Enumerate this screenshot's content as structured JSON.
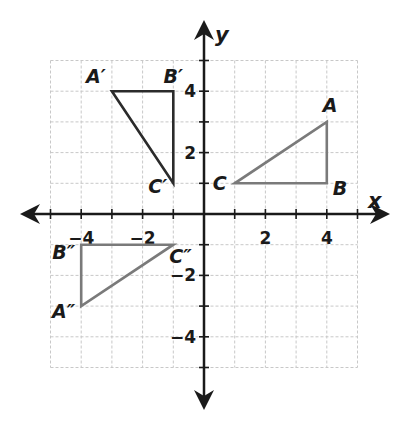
{
  "diagram": {
    "type": "coordinate-plane",
    "grid": {
      "xmin": -5,
      "xmax": 5,
      "ymin": -5,
      "ymax": 5,
      "step": 1,
      "color": "#c8c8c8"
    },
    "axes": {
      "x_label": "x",
      "y_label": "y",
      "color": "#1a1a1a"
    },
    "x_ticks": [
      {
        "value": -4,
        "label": "−4"
      },
      {
        "value": -2,
        "label": "−2"
      },
      {
        "value": 2,
        "label": "2"
      },
      {
        "value": 4,
        "label": "4"
      }
    ],
    "y_ticks": [
      {
        "value": 4,
        "label": "4"
      },
      {
        "value": 2,
        "label": "2"
      },
      {
        "value": -2,
        "label": "−2"
      },
      {
        "value": -4,
        "label": "−4"
      }
    ],
    "triangles": [
      {
        "name": "ABC",
        "color": "#7a7a7a",
        "vertices": [
          {
            "label": "A",
            "x": 4,
            "y": 3
          },
          {
            "label": "B",
            "x": 4,
            "y": 1
          },
          {
            "label": "C",
            "x": 1,
            "y": 1
          }
        ]
      },
      {
        "name": "A'B'C'",
        "color": "#2b2b2b",
        "vertices": [
          {
            "label": "A′",
            "x": -3,
            "y": 4
          },
          {
            "label": "B′",
            "x": -1,
            "y": 4
          },
          {
            "label": "C′",
            "x": -1,
            "y": 1
          }
        ]
      },
      {
        "name": "A''B''C''",
        "color": "#7a7a7a",
        "vertices": [
          {
            "label": "A″",
            "x": -4,
            "y": -3
          },
          {
            "label": "B″",
            "x": -4,
            "y": -1
          },
          {
            "label": "C″",
            "x": -1,
            "y": -1
          }
        ]
      }
    ]
  }
}
